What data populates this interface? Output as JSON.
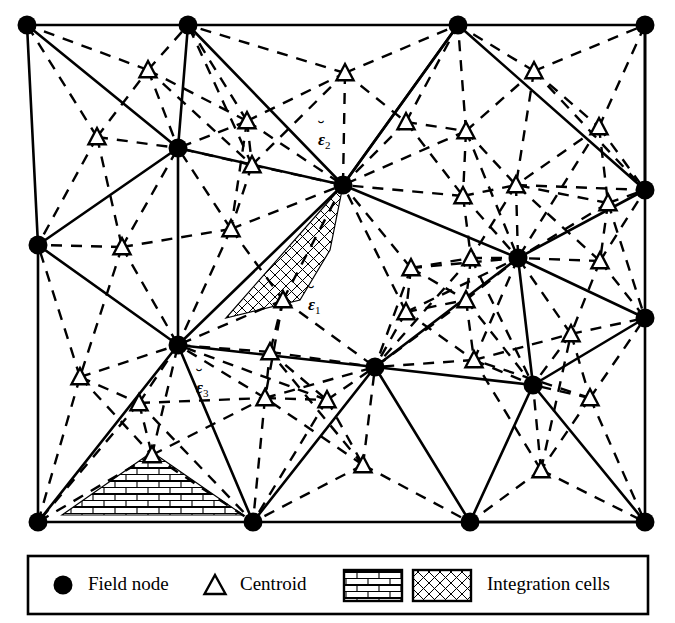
{
  "figure": {
    "type": "mesh-diagram",
    "domain_rect": {
      "x": 22,
      "y": 22,
      "width": 628,
      "height": 504
    }
  },
  "labels": [
    {
      "id": "eps1",
      "base": "ε",
      "accent": "breve",
      "subscript": "1",
      "x": 308,
      "y": 296
    },
    {
      "id": "eps2",
      "base": "ε",
      "accent": "breve",
      "subscript": "2",
      "x": 318,
      "y": 131
    },
    {
      "id": "eps3",
      "base": "ε",
      "accent": "breve",
      "subscript": "3",
      "x": 196,
      "y": 379
    }
  ],
  "legend": {
    "box": {
      "x": 28,
      "y": 556,
      "width": 620,
      "height": 58
    },
    "items": [
      {
        "marker": "filled-circle",
        "label": "Field node"
      },
      {
        "marker": "open-triangle",
        "label": "Centroid"
      },
      {
        "marker": "brick-swatch",
        "label": ""
      },
      {
        "marker": "hatch-swatch",
        "label": "Integration cells"
      }
    ]
  },
  "colors": {
    "stroke": "#000000",
    "background": "#ffffff",
    "node_fill": "#000000",
    "centroid_fill": "#ffffff"
  },
  "chart_data": {
    "type": "scatter",
    "title": "",
    "field_nodes": [
      [
        27,
        25
      ],
      [
        188,
        25
      ],
      [
        458,
        25
      ],
      [
        645,
        25
      ],
      [
        178,
        148
      ],
      [
        343,
        185
      ],
      [
        38,
        245
      ],
      [
        645,
        190
      ],
      [
        518,
        258
      ],
      [
        645,
        318
      ],
      [
        178,
        345
      ],
      [
        375,
        367
      ],
      [
        533,
        385
      ],
      [
        38,
        522
      ],
      [
        253,
        522
      ],
      [
        470,
        522
      ],
      [
        645,
        522
      ]
    ],
    "centroids": [
      [
        97,
        137
      ],
      [
        148,
        70
      ],
      [
        247,
        121
      ],
      [
        252,
        165
      ],
      [
        345,
        73
      ],
      [
        406,
        122
      ],
      [
        466,
        131
      ],
      [
        534,
        71
      ],
      [
        463,
        196
      ],
      [
        516,
        185
      ],
      [
        599,
        127
      ],
      [
        608,
        203
      ],
      [
        122,
        247
      ],
      [
        231,
        229
      ],
      [
        283,
        300
      ],
      [
        411,
        268
      ],
      [
        471,
        258
      ],
      [
        600,
        261
      ],
      [
        80,
        377
      ],
      [
        139,
        403
      ],
      [
        265,
        398
      ],
      [
        270,
        352
      ],
      [
        327,
        400
      ],
      [
        406,
        312
      ],
      [
        466,
        300
      ],
      [
        474,
        360
      ],
      [
        571,
        334
      ],
      [
        590,
        398
      ],
      [
        152,
        455
      ],
      [
        363,
        465
      ],
      [
        541,
        470
      ]
    ],
    "solid_edges": [
      [
        [
          27,
          25
        ],
        [
          188,
          25
        ]
      ],
      [
        [
          188,
          25
        ],
        [
          458,
          25
        ]
      ],
      [
        [
          458,
          25
        ],
        [
          645,
          25
        ]
      ],
      [
        [
          27,
          25
        ],
        [
          38,
          245
        ]
      ],
      [
        [
          38,
          245
        ],
        [
          38,
          522
        ]
      ],
      [
        [
          645,
          25
        ],
        [
          645,
          190
        ]
      ],
      [
        [
          645,
          190
        ],
        [
          645,
          318
        ]
      ],
      [
        [
          645,
          318
        ],
        [
          645,
          522
        ]
      ],
      [
        [
          38,
          522
        ],
        [
          253,
          522
        ]
      ],
      [
        [
          253,
          522
        ],
        [
          470,
          522
        ]
      ],
      [
        [
          470,
          522
        ],
        [
          645,
          522
        ]
      ],
      [
        [
          27,
          25
        ],
        [
          178,
          148
        ]
      ],
      [
        [
          188,
          25
        ],
        [
          178,
          148
        ]
      ],
      [
        [
          188,
          25
        ],
        [
          343,
          185
        ]
      ],
      [
        [
          458,
          25
        ],
        [
          343,
          185
        ]
      ],
      [
        [
          458,
          25
        ],
        [
          645,
          190
        ]
      ],
      [
        [
          645,
          25
        ],
        [
          645,
          190
        ]
      ],
      [
        [
          178,
          148
        ],
        [
          343,
          185
        ]
      ],
      [
        [
          178,
          148
        ],
        [
          38,
          245
        ]
      ],
      [
        [
          178,
          148
        ],
        [
          178,
          345
        ]
      ],
      [
        [
          343,
          185
        ],
        [
          518,
          258
        ]
      ],
      [
        [
          343,
          185
        ],
        [
          178,
          345
        ]
      ],
      [
        [
          518,
          258
        ],
        [
          645,
          190
        ]
      ],
      [
        [
          518,
          258
        ],
        [
          645,
          318
        ]
      ],
      [
        [
          518,
          258
        ],
        [
          375,
          367
        ]
      ],
      [
        [
          518,
          258
        ],
        [
          533,
          385
        ]
      ],
      [
        [
          38,
          245
        ],
        [
          178,
          345
        ]
      ],
      [
        [
          178,
          345
        ],
        [
          375,
          367
        ]
      ],
      [
        [
          178,
          345
        ],
        [
          38,
          522
        ]
      ],
      [
        [
          178,
          345
        ],
        [
          253,
          522
        ]
      ],
      [
        [
          375,
          367
        ],
        [
          253,
          522
        ]
      ],
      [
        [
          375,
          367
        ],
        [
          533,
          385
        ]
      ],
      [
        [
          533,
          385
        ],
        [
          470,
          522
        ]
      ],
      [
        [
          533,
          385
        ],
        [
          645,
          318
        ]
      ],
      [
        [
          533,
          385
        ],
        [
          645,
          522
        ]
      ],
      [
        [
          470,
          522
        ],
        [
          645,
          522
        ]
      ],
      [
        [
          343,
          185
        ],
        [
          458,
          25
        ]
      ],
      [
        [
          375,
          367
        ],
        [
          470,
          522
        ]
      ]
    ],
    "highlighted_cells": [
      {
        "pattern": "hatch",
        "label_ref": "eps1",
        "polygon": [
          [
            343,
            185
          ],
          [
            226,
            318
          ],
          [
            300,
            300
          ],
          [
            330,
            250
          ]
        ]
      },
      {
        "pattern": "brick",
        "label_ref": "eps3",
        "polygon": [
          [
            62,
            515
          ],
          [
            152,
            452
          ],
          [
            243,
            515
          ]
        ]
      }
    ],
    "legend_position": "bottom",
    "grid": false
  }
}
